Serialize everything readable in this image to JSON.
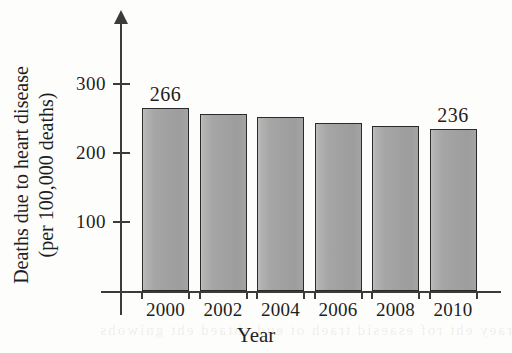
{
  "chart_data": {
    "type": "bar",
    "title": "",
    "subtitle": "",
    "xlabel": "Year",
    "ylabel": "Deaths due to heart disease (per 100,000 deaths)",
    "ylabel_line1": "Deaths due to heart disease",
    "ylabel_line2": "(per 100,000 deaths)",
    "categories": [
      "2000",
      "2002",
      "2004",
      "2006",
      "2008",
      "2010"
    ],
    "values": [
      266,
      257,
      252,
      244,
      240,
      236
    ],
    "value_labels": [
      "266",
      "",
      "",
      "",
      "",
      "236"
    ],
    "ylim": [
      0,
      330
    ],
    "yticks": [
      100,
      200,
      300
    ],
    "ytick_labels": [
      "100",
      "200",
      "300"
    ],
    "grid": false,
    "legend": false,
    "legend_position": "none",
    "axis_arrow_y": true,
    "colors": {
      "bar_fill_light": "#bfbfbf",
      "bar_fill_dark": "#9d9d9d",
      "bar_border": "#2a2a2a",
      "axis": "#3b3b3b",
      "text": "#1f1f1f",
      "background": "#fdfdfb"
    }
  },
  "figure": {
    "ghost_text": "reverse-page bleed-through"
  }
}
